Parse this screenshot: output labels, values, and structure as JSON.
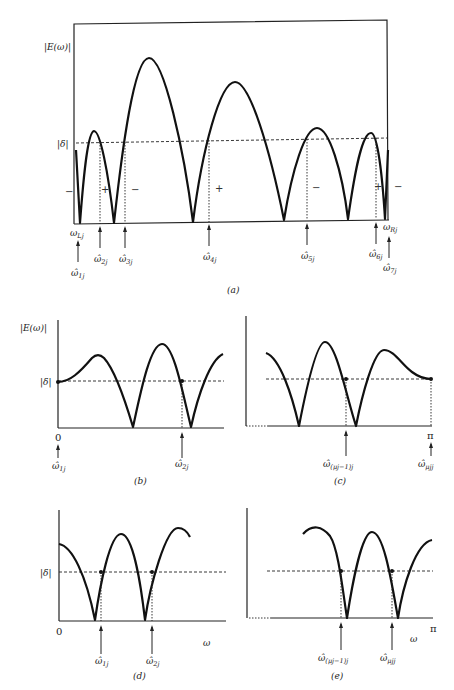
{
  "panel_a": {
    "ylabel": "|E(ω)|",
    "delta_label": "|δ|",
    "signs": [
      "−",
      "+",
      "−",
      "+",
      "−",
      "+",
      "−"
    ],
    "left_edge": "ω",
    "left_edge_sub": "Lj",
    "right_edge": "ω",
    "right_edge_sub": "Rj",
    "extremal_labels": [
      {
        "base": "ω̂",
        "sub": "1j"
      },
      {
        "base": "ω̂",
        "sub": "2j"
      },
      {
        "base": "ω̂",
        "sub": "3j"
      },
      {
        "base": "ω̂",
        "sub": "4j"
      },
      {
        "base": "ω̂",
        "sub": "5j"
      },
      {
        "base": "ω̂",
        "sub": "6j"
      },
      {
        "base": "ω̂",
        "sub": "7j"
      }
    ],
    "caption": "(a)"
  },
  "panel_b": {
    "ylabel": "|E(ω)|",
    "delta_label": "|δ|",
    "zero_label": "0",
    "extremal_labels": [
      {
        "base": "ω̂",
        "sub": "1j"
      },
      {
        "base": "ω̂",
        "sub": "2j"
      }
    ],
    "caption": "(b)"
  },
  "panel_c": {
    "pi_label": "π",
    "extremal_labels": [
      {
        "base": "ω̂",
        "sub": "(μj−1)j"
      },
      {
        "base": "ω̂",
        "sub": "μjj"
      }
    ],
    "caption": "(c)"
  },
  "panel_d": {
    "delta_label": "|δ|",
    "zero_label": "0",
    "xlabel": "ω",
    "extremal_labels": [
      {
        "base": "ω̂",
        "sub": "1j"
      },
      {
        "base": "ω̂",
        "sub": "2j"
      }
    ],
    "caption": "(d)"
  },
  "panel_e": {
    "pi_label": "π",
    "xlabel": "ω",
    "extremal_labels": [
      {
        "base": "ω̂",
        "sub": "(μj−1)j"
      },
      {
        "base": "ω̂",
        "sub": "μjj"
      }
    ],
    "caption": "(e)"
  }
}
